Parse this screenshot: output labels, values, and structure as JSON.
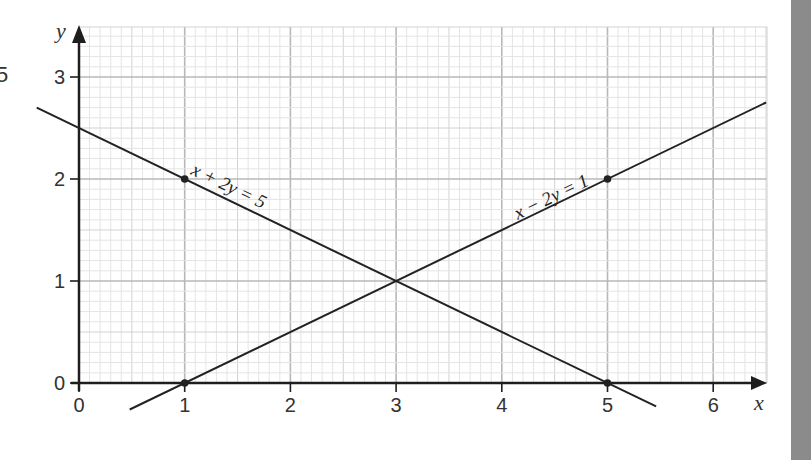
{
  "chart_data": {
    "type": "line",
    "title": "",
    "xlabel": "x",
    "ylabel": "y",
    "xlim": [
      0,
      6.5
    ],
    "ylim": [
      0,
      3.5
    ],
    "grid": true,
    "grid_minor_subdivisions": 10,
    "x_ticks": [
      0,
      1,
      2,
      3,
      4,
      5,
      6
    ],
    "x_tick_labels": [
      "0",
      "1",
      "2",
      "3",
      "4",
      "5",
      "6"
    ],
    "y_ticks": [
      0,
      1,
      2,
      3
    ],
    "y_tick_labels": [
      "0",
      "1",
      "2",
      "3"
    ],
    "series": [
      {
        "name": "x + 2y = 5",
        "equation": "x + 2y = 5",
        "label_parts": [
          "x + 2",
          "y",
          " = 5"
        ],
        "x": [
          -0.4,
          5.46
        ],
        "y": [
          2.7,
          -0.23
        ],
        "points": [
          {
            "x": 1,
            "y": 2
          },
          {
            "x": 5,
            "y": 0
          }
        ],
        "label_at": {
          "x": 1.05,
          "y": 2.05
        },
        "color": "#222222"
      },
      {
        "name": "x - 2y = 1",
        "equation": "x - 2y = 1",
        "x": [
          0.48,
          6.5
        ],
        "y": [
          -0.26,
          2.75
        ],
        "points": [
          {
            "x": 1,
            "y": 0
          },
          {
            "x": 5,
            "y": 2
          }
        ],
        "label_at": {
          "x": 4.15,
          "y": 1.6
        },
        "color": "#222222"
      }
    ],
    "intersection": {
      "x": 3,
      "y": 1
    }
  },
  "labels": {
    "line1": "x + 2y = 5",
    "line2": "x − 2y = 1",
    "x_axis": "x",
    "y_axis": "y",
    "cut_off_text": "5"
  },
  "colors": {
    "major_grid": "#b8b8b8",
    "minor_grid": "#e4e4e4",
    "mid_grid": "#d2d2d2",
    "axis": "#1e1e1e",
    "side_bar": "#8b8b8b"
  }
}
